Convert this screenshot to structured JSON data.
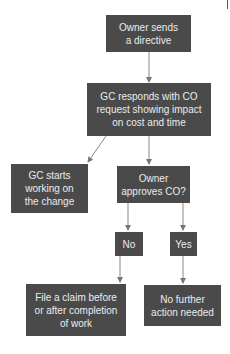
{
  "diagram": {
    "type": "flowchart",
    "colors": {
      "node_fill": "#4a4a4a",
      "node_text": "#ececec",
      "edge": "#777777",
      "background": "#ffffff"
    },
    "nodes": [
      {
        "id": "owner-directive",
        "label": "Owner sends\na directive"
      },
      {
        "id": "gc-responds",
        "label": "GC responds with CO\nrequest showing impact\non cost and time"
      },
      {
        "id": "gc-starts",
        "label": "GC starts\nworking on\nthe change"
      },
      {
        "id": "owner-approves",
        "label": "Owner\napproves CO?"
      },
      {
        "id": "no",
        "label": "No"
      },
      {
        "id": "yes",
        "label": "Yes"
      },
      {
        "id": "file-claim",
        "label": "File a claim before\nor after completion\nof work"
      },
      {
        "id": "no-action",
        "label": "No further\naction needed"
      }
    ],
    "edges": [
      {
        "from": "owner-directive",
        "to": "gc-responds"
      },
      {
        "from": "gc-responds",
        "to": "gc-starts"
      },
      {
        "from": "gc-responds",
        "to": "owner-approves"
      },
      {
        "from": "owner-approves",
        "to": "no"
      },
      {
        "from": "owner-approves",
        "to": "yes"
      },
      {
        "from": "no",
        "to": "file-claim"
      },
      {
        "from": "yes",
        "to": "no-action"
      }
    ]
  }
}
